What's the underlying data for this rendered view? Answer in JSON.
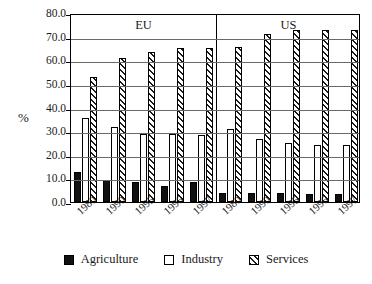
{
  "chart_data": {
    "type": "bar",
    "title": "",
    "xlabel": "",
    "ylabel": "%",
    "ylim": [
      0,
      80
    ],
    "ytick_step": 10,
    "ytick_labels": [
      "80.0",
      "70.0",
      "60.0",
      "50.0",
      "40.0",
      "30.0",
      "20.0",
      "10.0",
      "0.0"
    ],
    "grid": true,
    "legend_position": "bottom",
    "region_labels": [
      "EU",
      "US"
    ],
    "categories": [
      "1980",
      "1990",
      "1995",
      "1996",
      "1997",
      "1980",
      "1990",
      "1995",
      "1996",
      "1997"
    ],
    "groups": [
      {
        "region": "EU",
        "year": "1980",
        "Agriculture": 12.7,
        "Industry": 35.5,
        "Services": 53.0
      },
      {
        "region": "EU",
        "year": "1990",
        "Agriculture": 9.2,
        "Industry": 31.6,
        "Services": 61.0
      },
      {
        "region": "EU",
        "year": "1995",
        "Agriculture": 8.4,
        "Industry": 28.8,
        "Services": 63.5
      },
      {
        "region": "EU",
        "year": "1996",
        "Agriculture": 6.9,
        "Industry": 28.8,
        "Services": 65.0
      },
      {
        "region": "EU",
        "year": "1997",
        "Agriculture": 8.4,
        "Industry": 28.2,
        "Services": 65.0
      },
      {
        "region": "US",
        "year": "1980",
        "Agriculture": 4.0,
        "Industry": 31.0,
        "Services": 65.5
      },
      {
        "region": "US",
        "year": "1990",
        "Agriculture": 3.9,
        "Industry": 26.8,
        "Services": 71.0
      },
      {
        "region": "US",
        "year": "1995",
        "Agriculture": 3.9,
        "Industry": 24.8,
        "Services": 73.0
      },
      {
        "region": "US",
        "year": "1996",
        "Agriculture": 3.3,
        "Industry": 24.1,
        "Services": 73.0
      },
      {
        "region": "US",
        "year": "1997",
        "Agriculture": 3.3,
        "Industry": 24.1,
        "Services": 73.0
      }
    ],
    "series": [
      {
        "name": "Agriculture",
        "values": [
          12.7,
          9.2,
          8.4,
          6.9,
          8.4,
          4.0,
          3.9,
          3.9,
          3.3,
          3.3
        ],
        "fill": "solid-black"
      },
      {
        "name": "Industry",
        "values": [
          35.5,
          31.6,
          28.8,
          28.8,
          28.2,
          31.0,
          26.8,
          24.8,
          24.1,
          24.1
        ],
        "fill": "white"
      },
      {
        "name": "Services",
        "values": [
          53.0,
          61.0,
          63.5,
          65.0,
          65.0,
          65.5,
          71.0,
          73.0,
          73.0,
          73.0
        ],
        "fill": "diagonal-hatch"
      }
    ]
  },
  "legend": {
    "items": [
      {
        "label": "Agriculture",
        "key": "agriculture"
      },
      {
        "label": "Industry",
        "key": "industry"
      },
      {
        "label": "Services",
        "key": "services"
      }
    ]
  }
}
